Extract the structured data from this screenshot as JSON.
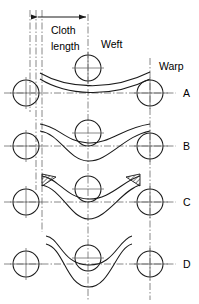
{
  "figure": {
    "background_color": "#ffffff",
    "line_color": "#1a1a1a",
    "centerline_color": "#6a6a6a",
    "hatch_color": "#2b2b2b"
  },
  "dimension": {
    "label_line_1": "Cloth",
    "label_line_2": "length",
    "arrow_left_x": 36,
    "arrow_right_x": 88,
    "y": 17
  },
  "callouts": [
    {
      "name": "weft",
      "text": "Weft",
      "x": 101,
      "y": 48
    },
    {
      "name": "warp",
      "text": "Warp",
      "x": 159,
      "y": 70
    }
  ],
  "rows": [
    {
      "id": "A",
      "label": "A",
      "label_x": 183,
      "label_y": 96,
      "center_y": 93,
      "amplitude": 10,
      "style": "shallow-sag"
    },
    {
      "id": "B",
      "label": "B",
      "label_x": 183,
      "label_y": 149,
      "center_y": 146,
      "amplitude": 22,
      "style": "wave"
    },
    {
      "id": "C",
      "label": "C",
      "label_x": 183,
      "label_y": 205,
      "center_y": 202,
      "amplitude": 25,
      "style": "wave-hatched"
    },
    {
      "id": "D",
      "label": "D",
      "label_x": 183,
      "label_y": 267,
      "center_y": 264,
      "amplitude": 28,
      "style": "wave-tight"
    }
  ],
  "circles": {
    "radius": 13,
    "columns_x": [
      26,
      88,
      150
    ],
    "note": "warp cross-sections drawn as circles with cross centre marks"
  },
  "vertical_centerlines_x": [
    30,
    36,
    42,
    88,
    150
  ],
  "hatched_regions": [
    {
      "name": "hatch-left",
      "x": 42,
      "y": 175
    },
    {
      "name": "hatch-right",
      "x": 139,
      "y": 175
    }
  ]
}
